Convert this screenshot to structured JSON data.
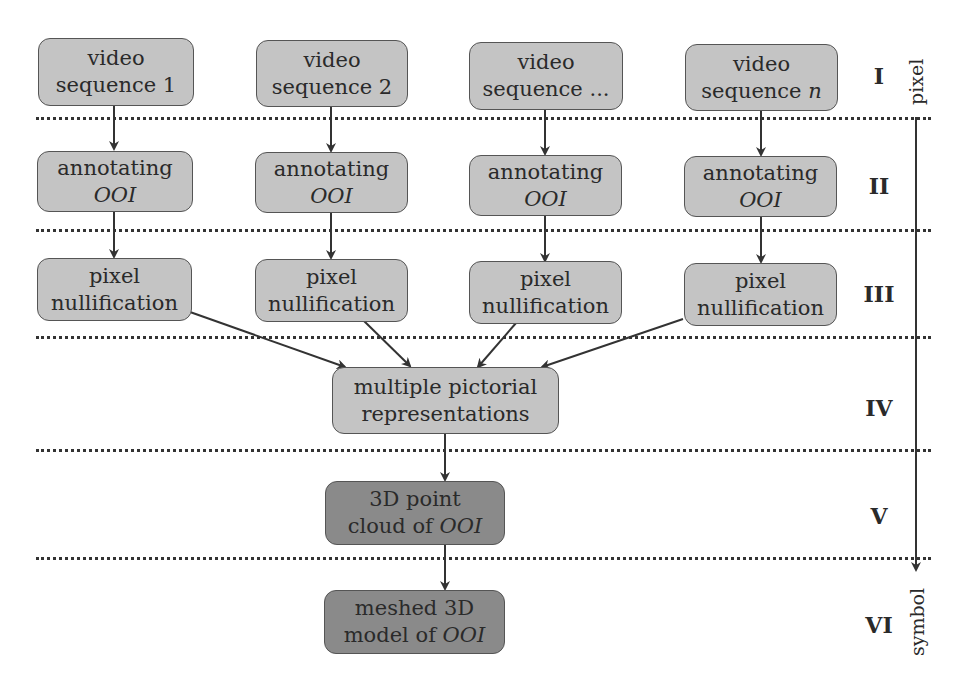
{
  "diagram": {
    "rows": {
      "video": [
        {
          "l1": "video",
          "l2": "sequence 1"
        },
        {
          "l1": "video",
          "l2": "sequence 2"
        },
        {
          "l1": "video",
          "l2": "sequence ..."
        },
        {
          "l1": "video",
          "l2pre": "sequence ",
          "l2it": "n"
        }
      ],
      "annotate": [
        {
          "l1": "annotating",
          "l2": "OOI"
        },
        {
          "l1": "annotating",
          "l2": "OOI"
        },
        {
          "l1": "annotating",
          "l2": "OOI"
        },
        {
          "l1": "annotating",
          "l2": "OOI"
        }
      ],
      "nullify": [
        {
          "l1": "pixel",
          "l2": "nullification"
        },
        {
          "l1": "pixel",
          "l2": "nullification"
        },
        {
          "l1": "pixel",
          "l2": "nullification"
        },
        {
          "l1": "pixel",
          "l2": "nullification"
        }
      ]
    },
    "multi": {
      "l1": "multiple pictorial",
      "l2": "representations"
    },
    "pointcloud": {
      "l1": "3D point",
      "l2pre": "cloud of ",
      "l2it": "OOI"
    },
    "mesh": {
      "l1": "meshed 3D",
      "l2pre": "model of ",
      "l2it": "OOI"
    },
    "stages": [
      "I",
      "II",
      "III",
      "IV",
      "V",
      "VI"
    ],
    "axis": {
      "top": "pixel",
      "bottom": "symbol"
    },
    "colors": {
      "light_box": "#c4c4c4",
      "dark_box": "#8a8a8a",
      "border": "#555555",
      "line": "#333333"
    }
  }
}
